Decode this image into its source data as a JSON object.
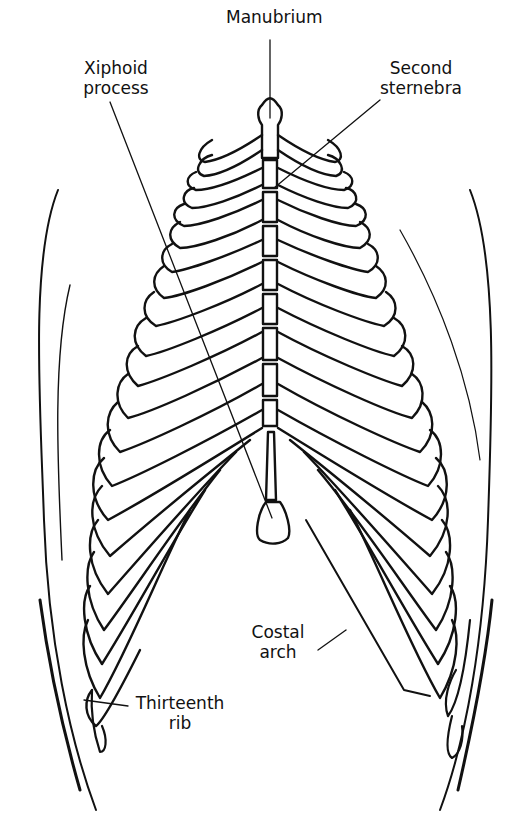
{
  "diagram": {
    "colors": {
      "line": "#111111",
      "background": "#ffffff"
    },
    "labels": [
      {
        "id": "manubrium",
        "lines": [
          "Manubrium"
        ],
        "x": 226,
        "y": 7,
        "w": 80
      },
      {
        "id": "xiphoid",
        "lines": [
          "Xiphoid",
          "process"
        ],
        "x": 78,
        "y": 58,
        "w": 76
      },
      {
        "id": "second-sternebra",
        "lines": [
          "Second",
          "sternebra"
        ],
        "x": 378,
        "y": 58,
        "w": 84
      },
      {
        "id": "costal-arch",
        "lines": [
          "Costal",
          "arch"
        ],
        "x": 245,
        "y": 622,
        "w": 64
      },
      {
        "id": "thirteenth-rib",
        "lines": [
          "Thirteenth",
          "rib"
        ],
        "x": 128,
        "y": 693,
        "w": 100
      }
    ]
  }
}
